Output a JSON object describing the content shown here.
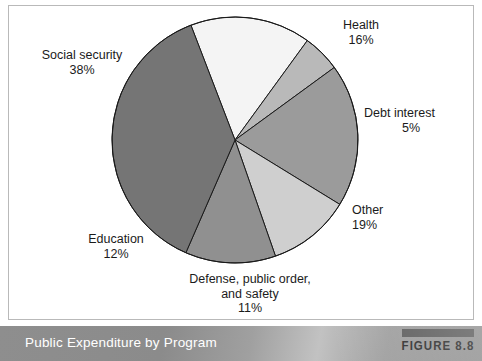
{
  "figure": {
    "caption": "Public Expenditure by Program",
    "badge_label": "FIGURE 8.8"
  },
  "chart_data": {
    "type": "pie",
    "title": "Public Expenditure by Program",
    "xlabel": "",
    "ylabel": "",
    "units": "percent",
    "start_angle_deg": -21,
    "direction": "clockwise",
    "legend": "none (direct labels)",
    "grid": false,
    "categories": [
      "Health",
      "Debt interest",
      "Other",
      "Defense, public order, and safety",
      "Education",
      "Social security"
    ],
    "values": [
      16,
      5,
      19,
      11,
      12,
      38
    ],
    "slices": [
      {
        "name": "Health",
        "label_line1": "Health",
        "label_line2": "",
        "value": 16,
        "value_text": "16%",
        "color": "#f4f4f4"
      },
      {
        "name": "Debt interest",
        "label_line1": "Debt interest",
        "label_line2": "",
        "value": 5,
        "value_text": "5%",
        "color": "#b9b9b9"
      },
      {
        "name": "Other",
        "label_line1": "Other",
        "label_line2": "",
        "value": 19,
        "value_text": "19%",
        "color": "#9b9b9b"
      },
      {
        "name": "Defense, public order, and safety",
        "label_line1": "Defense, public order,",
        "label_line2": "and safety",
        "value": 11,
        "value_text": "11%",
        "color": "#cfcfcf"
      },
      {
        "name": "Education",
        "label_line1": "Education",
        "label_line2": "",
        "value": 12,
        "value_text": "12%",
        "color": "#909090"
      },
      {
        "name": "Social security",
        "label_line1": "Social security",
        "label_line2": "",
        "value": 38,
        "value_text": "38%",
        "color": "#757575"
      }
    ],
    "geometry": {
      "center_x": 235,
      "center_y": 140,
      "radius": 123,
      "stroke_color": "#1a1a1a"
    }
  }
}
